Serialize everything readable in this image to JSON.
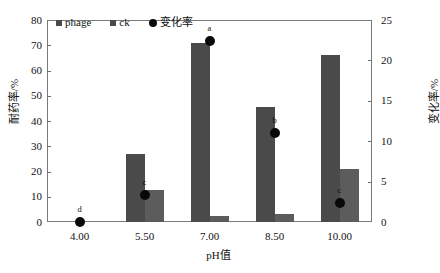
{
  "chart_data": {
    "type": "bar",
    "title": "",
    "xlabel": "pH值",
    "ylabel": "耐药率/%",
    "ylabel_secondary": "变化率/%",
    "categories": [
      "4.00",
      "5.50",
      "7.00",
      "8.50",
      "10.00"
    ],
    "ylim": [
      0,
      80
    ],
    "yticks": [
      "0",
      "10",
      "20",
      "30",
      "40",
      "50",
      "60",
      "70",
      "80"
    ],
    "ylim_secondary": [
      0,
      25
    ],
    "yticks_secondary": [
      "0",
      "5",
      "10",
      "15",
      "20",
      "25"
    ],
    "grid": false,
    "legend_position": "top-left-inside",
    "series": [
      {
        "name": "phage",
        "axis": "left",
        "type": "bar",
        "color": "#4a4a4a",
        "values": [
          0,
          26.8,
          70.8,
          45.6,
          66.0
        ]
      },
      {
        "name": "ck",
        "axis": "left",
        "type": "bar",
        "color": "#5c5c5c",
        "values": [
          0,
          12.5,
          2.4,
          3.1,
          20.8
        ]
      },
      {
        "name": "变化率",
        "axis": "right",
        "type": "scatter",
        "color": "#080808",
        "values": [
          0,
          3.4,
          22.4,
          11.0,
          2.3
        ]
      }
    ],
    "annotations": [
      {
        "category": "4.00",
        "label": "d"
      },
      {
        "category": "5.50",
        "label": "c"
      },
      {
        "category": "7.00",
        "label": "a"
      },
      {
        "category": "8.50",
        "label": "b"
      },
      {
        "category": "10.00",
        "label": "c"
      }
    ]
  },
  "legend": {
    "items": [
      {
        "label": "phage",
        "marker": "square-icon"
      },
      {
        "label": "ck",
        "marker": "square-icon"
      },
      {
        "label": "变化率",
        "marker": "circle-icon"
      }
    ]
  }
}
